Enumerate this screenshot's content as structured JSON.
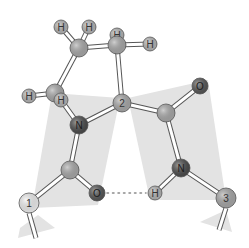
{
  "diagram": {
    "type": "molecular-ball-and-stick",
    "colors": {
      "background": "#ffffff",
      "plane": "#e3e3e3",
      "carbon": "#a9a9a9",
      "hydrogen": "#b5b5b5",
      "nitrogen": "#4a4a4a",
      "oxygen": "#555555",
      "residue_1": "#f2f2f2",
      "residue_3": "#a9a9a9",
      "bond_fill": "#ffffff",
      "bond_stroke": "#555555",
      "hbond": "#8a8a8a"
    },
    "planes": [
      {
        "id": "plane-left",
        "points": "52,93 120,98 98,205 32,208"
      },
      {
        "id": "plane-right",
        "points": "128,98 208,80 226,200 150,200"
      },
      {
        "id": "plane-bottom-left",
        "points": "20,228 38,215 55,228 18,238"
      },
      {
        "id": "plane-bottom-right",
        "points": "200,222 226,210 232,232"
      }
    ],
    "atoms": [
      {
        "id": "h1",
        "element": "H",
        "label": "H",
        "x": 61,
        "y": 27,
        "r": 7
      },
      {
        "id": "h2",
        "element": "H",
        "label": "H",
        "x": 89,
        "y": 27,
        "r": 7
      },
      {
        "id": "h3-back",
        "element": "H",
        "label": "H",
        "x": 117,
        "y": 35,
        "r": 7
      },
      {
        "id": "c-gamma",
        "element": "C",
        "label": "",
        "x": 79,
        "y": 48,
        "r": 9
      },
      {
        "id": "c-beta",
        "element": "C",
        "label": "",
        "x": 117,
        "y": 45,
        "r": 9
      },
      {
        "id": "h4",
        "element": "H",
        "label": "H",
        "x": 150,
        "y": 44,
        "r": 7
      },
      {
        "id": "h5",
        "element": "H",
        "label": "H",
        "x": 29,
        "y": 96,
        "r": 7
      },
      {
        "id": "c-delta",
        "element": "C",
        "label": "",
        "x": 55,
        "y": 93,
        "r": 9
      },
      {
        "id": "h6",
        "element": "H",
        "label": "H",
        "x": 61,
        "y": 100,
        "r": 7
      },
      {
        "id": "n-1",
        "element": "N",
        "label": "N",
        "x": 79,
        "y": 125,
        "r": 9
      },
      {
        "id": "calpha-2",
        "element": "C",
        "label": "2",
        "x": 122,
        "y": 103,
        "r": 9
      },
      {
        "id": "c-carbonyl-2",
        "element": "C",
        "label": "",
        "x": 166,
        "y": 113,
        "r": 9
      },
      {
        "id": "o-2",
        "element": "O",
        "label": "O",
        "x": 200,
        "y": 86,
        "r": 8
      },
      {
        "id": "c-carbonyl-1",
        "element": "C",
        "label": "",
        "x": 70,
        "y": 170,
        "r": 9
      },
      {
        "id": "o-1",
        "element": "O",
        "label": "O",
        "x": 97,
        "y": 193,
        "r": 8
      },
      {
        "id": "calpha-1",
        "element": "C",
        "label": "1",
        "x": 29,
        "y": 203,
        "r": 10
      },
      {
        "id": "n-3",
        "element": "N",
        "label": "N",
        "x": 181,
        "y": 168,
        "r": 9
      },
      {
        "id": "h-n3",
        "element": "H",
        "label": "H",
        "x": 155,
        "y": 193,
        "r": 7
      },
      {
        "id": "calpha-3",
        "element": "C",
        "label": "3",
        "x": 226,
        "y": 198,
        "r": 10
      }
    ],
    "bonds": [
      {
        "from": "h1",
        "to": "c-gamma"
      },
      {
        "from": "h2",
        "to": "c-gamma"
      },
      {
        "from": "c-gamma",
        "to": "c-beta"
      },
      {
        "from": "h3-back",
        "to": "c-beta"
      },
      {
        "from": "c-beta",
        "to": "h4"
      },
      {
        "from": "c-gamma",
        "to": "c-delta"
      },
      {
        "from": "h5",
        "to": "c-delta"
      },
      {
        "from": "c-delta",
        "to": "h6"
      },
      {
        "from": "h6",
        "to": "n-1"
      },
      {
        "from": "c-beta",
        "to": "calpha-2"
      },
      {
        "from": "n-1",
        "to": "calpha-2"
      },
      {
        "from": "calpha-2",
        "to": "c-carbonyl-2"
      },
      {
        "from": "c-carbonyl-2",
        "to": "o-2"
      },
      {
        "from": "c-carbonyl-2",
        "to": "n-3"
      },
      {
        "from": "n-3",
        "to": "h-n3"
      },
      {
        "from": "n-3",
        "to": "calpha-3"
      },
      {
        "from": "n-1",
        "to": "c-carbonyl-1"
      },
      {
        "from": "c-carbonyl-1",
        "to": "o-1"
      },
      {
        "from": "c-carbonyl-1",
        "to": "calpha-1"
      }
    ],
    "stub_bonds": [
      {
        "x1": 29,
        "y1": 213,
        "x2": 36,
        "y2": 238
      },
      {
        "x1": 226,
        "y1": 208,
        "x2": 219,
        "y2": 230
      }
    ],
    "hydrogen_bond": {
      "from": "o-1",
      "to": "h-n3",
      "style": "dotted"
    }
  }
}
